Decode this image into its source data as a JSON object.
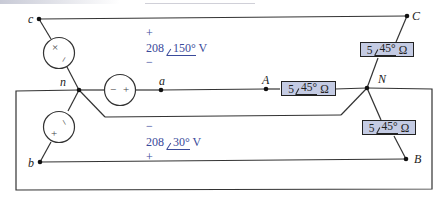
{
  "figure": {
    "type": "three-phase Y-Y circuit",
    "nodes": {
      "source_c": "c",
      "source_b": "b",
      "source_neutral": "n",
      "source_a": "a",
      "load_A": "A",
      "load_N": "N",
      "load_B": "B",
      "load_C": "C"
    },
    "sources": [
      {
        "id": "Vcn",
        "between": "c-n",
        "magnitude": "208",
        "angle": "150°",
        "unit": "V",
        "plus": "+",
        "minus": "−",
        "label_top": "+",
        "label_bottom": "−"
      },
      {
        "id": "Vbn",
        "between": "b-n",
        "magnitude": "208",
        "angle": "30°",
        "unit": "V",
        "label_top": "−",
        "label_bottom": "+"
      },
      {
        "id": "Van",
        "between": "n-a",
        "minus": "−",
        "plus": "+"
      }
    ],
    "loads": [
      {
        "id": "ZCN",
        "between": "C-N",
        "magnitude": "5",
        "angle": "45°",
        "unit": "Ω"
      },
      {
        "id": "ZAN",
        "between": "A-N",
        "magnitude": "5",
        "angle": "45°",
        "unit": "Ω"
      },
      {
        "id": "ZNB",
        "between": "N-B",
        "magnitude": "5",
        "angle": "45°",
        "unit": "Ω"
      }
    ],
    "source_glyphs": {
      "cn": {
        "top": "×",
        "bottom": "−"
      },
      "bn": {
        "top": "−",
        "bottom": "+"
      },
      "an": {
        "left": "−",
        "right": "+"
      }
    }
  }
}
